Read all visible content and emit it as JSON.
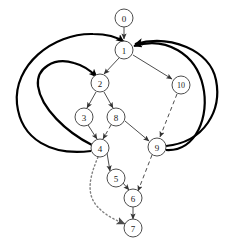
{
  "diagram": {
    "type": "directed-graph",
    "background_color": "#ffffff",
    "canvas": {
      "width": 227,
      "height": 244
    },
    "node_radius": 9,
    "colors": {
      "node_fill": "#ffffff",
      "node_stroke": "#4d4d4d",
      "label": "#1a1a1a",
      "edge_thin": "#4d4d4d",
      "edge_thick": "#000000",
      "edge_dotted": "#808080"
    },
    "nodes": [
      {
        "id": "n0",
        "label": "0",
        "x": 124,
        "y": 18
      },
      {
        "id": "n1",
        "label": "1",
        "x": 124,
        "y": 50
      },
      {
        "id": "n2",
        "label": "2",
        "x": 100,
        "y": 83
      },
      {
        "id": "n3",
        "label": "3",
        "x": 84,
        "y": 117
      },
      {
        "id": "n8",
        "label": "8",
        "x": 116,
        "y": 117
      },
      {
        "id": "n4",
        "label": "4",
        "x": 100,
        "y": 148
      },
      {
        "id": "n5",
        "label": "5",
        "x": 116,
        "y": 178
      },
      {
        "id": "n6",
        "label": "6",
        "x": 133,
        "y": 198
      },
      {
        "id": "n7",
        "label": "7",
        "x": 133,
        "y": 228
      },
      {
        "id": "n9",
        "label": "9",
        "x": 157,
        "y": 147
      },
      {
        "id": "n10",
        "label": "10",
        "x": 181,
        "y": 85
      }
    ],
    "edges": [
      {
        "from": "0",
        "to": "1",
        "style": "solid-thin"
      },
      {
        "from": "1",
        "to": "2",
        "style": "solid-thin"
      },
      {
        "from": "1",
        "to": "10",
        "style": "solid-thin"
      },
      {
        "from": "2",
        "to": "3",
        "style": "solid-thin"
      },
      {
        "from": "2",
        "to": "8",
        "style": "solid-thin"
      },
      {
        "from": "3",
        "to": "4",
        "style": "solid-thin"
      },
      {
        "from": "8",
        "to": "4",
        "style": "dashed"
      },
      {
        "from": "8",
        "to": "9",
        "style": "solid-thin"
      },
      {
        "from": "10",
        "to": "9",
        "style": "dashed"
      },
      {
        "from": "4",
        "to": "5",
        "style": "solid-thin"
      },
      {
        "from": "4",
        "to": "7",
        "style": "dotted"
      },
      {
        "from": "4",
        "to": "1",
        "style": "solid-thick"
      },
      {
        "from": "4",
        "to": "2",
        "style": "solid-thick"
      },
      {
        "from": "5",
        "to": "6",
        "style": "solid-thin"
      },
      {
        "from": "9",
        "to": "6",
        "style": "dashed"
      },
      {
        "from": "9",
        "to": "1",
        "style": "solid-thick"
      },
      {
        "from": "9",
        "to": "1b",
        "style": "solid-thick"
      },
      {
        "from": "6",
        "to": "7",
        "style": "solid-thin"
      }
    ]
  }
}
